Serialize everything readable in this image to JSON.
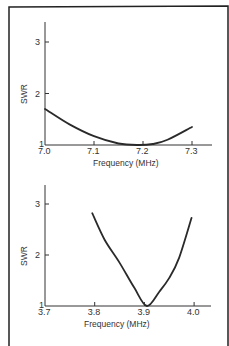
{
  "chart_data": [
    {
      "type": "line",
      "title": "",
      "xlabel": "Frequency (MHz)",
      "ylabel": "SWR",
      "xlim": [
        7.0,
        7.33
      ],
      "ylim": [
        1,
        3.4
      ],
      "x_ticks": [
        "7.0",
        "7.1",
        "7.2",
        "7.3"
      ],
      "y_ticks": [
        "1",
        "2",
        "3"
      ],
      "grid": false,
      "series": [
        {
          "name": "SWR (40 m band)",
          "x": [
            7.0,
            7.05,
            7.1,
            7.15,
            7.19,
            7.22,
            7.25,
            7.3
          ],
          "values": [
            1.7,
            1.4,
            1.17,
            1.03,
            1.0,
            1.02,
            1.1,
            1.35
          ]
        }
      ]
    },
    {
      "type": "line",
      "title": "",
      "xlabel": "Frequency (MHz)",
      "ylabel": "SWR",
      "xlim": [
        3.7,
        4.03
      ],
      "ylim": [
        1,
        3.4
      ],
      "x_ticks": [
        "3.7",
        "3.8",
        "3.9",
        "4.0"
      ],
      "y_ticks": [
        "1",
        "2",
        "3"
      ],
      "grid": false,
      "series": [
        {
          "name": "SWR (80 m band)",
          "x": [
            3.795,
            3.82,
            3.85,
            3.88,
            3.905,
            3.93,
            3.95,
            3.97,
            3.995
          ],
          "values": [
            2.82,
            2.3,
            1.85,
            1.35,
            1.0,
            1.28,
            1.55,
            1.95,
            2.73
          ]
        }
      ]
    }
  ]
}
